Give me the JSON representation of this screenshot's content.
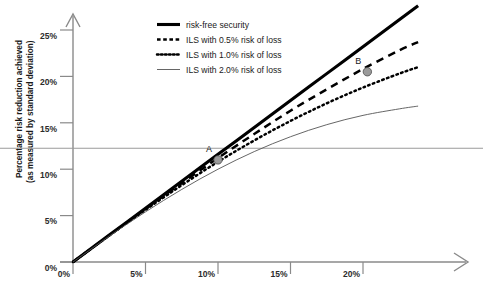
{
  "chart_data": {
    "type": "line",
    "title": "",
    "xlabel": "",
    "ylabel": "Percentage risk reduction achieved (as measured by standard deviation)",
    "ylabel_line1": "Percentage risk reduction achieved",
    "ylabel_line2": "(as measured by standard deviation)",
    "xlim": [
      0,
      25
    ],
    "ylim": [
      0,
      27
    ],
    "xticks": [
      "0%",
      "5%",
      "10%",
      "15%",
      "20%"
    ],
    "xtick_values": [
      0,
      5,
      10,
      15,
      20
    ],
    "yticks": [
      "0%",
      "5%",
      "10%",
      "15%",
      "20%",
      "25%"
    ],
    "ytick_values": [
      0,
      5,
      10,
      15,
      20,
      25
    ],
    "grid": false,
    "legend_position": "top-center",
    "reference_line": {
      "orientation": "horizontal",
      "value": 12.3,
      "label": ""
    },
    "series": [
      {
        "name": "risk-free security",
        "style": "solid-thick",
        "color": "#000000",
        "x": [
          0,
          2.5,
          5,
          7.5,
          10,
          12.5,
          15,
          17.5,
          20,
          22.5,
          23.8
        ],
        "y": [
          0,
          2.9,
          5.8,
          8.7,
          11.6,
          14.5,
          17.4,
          20.3,
          23.2,
          26.1,
          27.6
        ]
      },
      {
        "name": "ILS with 0.5% risk of loss",
        "style": "dashed",
        "color": "#000000",
        "x": [
          0,
          2.5,
          5,
          7.5,
          10,
          12.5,
          15,
          17.5,
          20,
          22.5,
          23.8
        ],
        "y": [
          0,
          2.88,
          5.72,
          8.5,
          11.2,
          13.8,
          16.3,
          18.6,
          20.8,
          22.8,
          23.7
        ]
      },
      {
        "name": "ILS with 1.0% risk of loss",
        "style": "dotted",
        "color": "#000000",
        "x": [
          0,
          2.5,
          5,
          7.5,
          10,
          12.5,
          15,
          17.5,
          20,
          22.5,
          23.8
        ],
        "y": [
          0,
          2.85,
          5.62,
          8.28,
          10.8,
          13.1,
          15.2,
          17.1,
          18.8,
          20.3,
          21.0
        ]
      },
      {
        "name": "ILS with 2.0% risk of loss",
        "style": "solid-thin",
        "color": "#555555",
        "x": [
          0,
          2.5,
          5,
          7.5,
          10,
          12.5,
          15,
          17.5,
          20,
          22.5,
          23.8
        ],
        "y": [
          0,
          2.78,
          5.4,
          7.82,
          10.0,
          11.9,
          13.5,
          14.8,
          15.8,
          16.5,
          16.8
        ]
      }
    ],
    "annotations": [
      {
        "label": "A",
        "x": 10.0,
        "y": 11.0
      },
      {
        "label": "B",
        "x": 20.3,
        "y": 20.5
      }
    ]
  },
  "legend": {
    "items": [
      {
        "label": "risk-free security",
        "style": "solid-thick"
      },
      {
        "label": "ILS with 0.5% risk of loss",
        "style": "dashed"
      },
      {
        "label": "ILS with 1.0% risk of loss",
        "style": "dotted"
      },
      {
        "label": "ILS with 2.0% risk of loss",
        "style": "solid-thin"
      }
    ]
  }
}
